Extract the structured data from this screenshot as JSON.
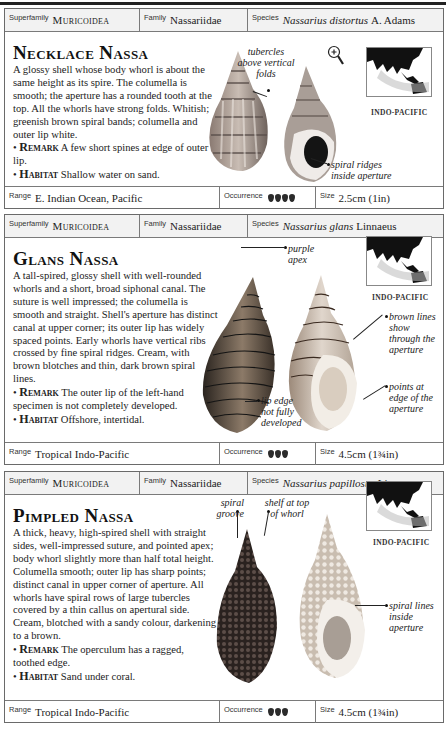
{
  "entries": [
    {
      "superfamily_label": "Superfamily",
      "superfamily": "Muricoidea",
      "family_label": "Family",
      "family": "Nassariidae",
      "species_label": "Species",
      "species_name": "Nassarius distortus",
      "species_author": "A. Adams",
      "title": "Necklace Nassa",
      "description": "A glossy shell whose body whorl is about the same height as its spire. The columella is smooth; the aperture has a rounded tooth at the top. All the whorls have strong folds. Whitish; greenish brown spiral bands; columella and outer lip white.",
      "remark_label": "Remark",
      "remark": "A few short spines at edge of outer lip.",
      "habitat_label": "Habitat",
      "habitat": "Shallow water on sand.",
      "annotations": [
        "tubercles above vertical folds",
        "spiral ridges inside aperture"
      ],
      "map_caption": "INDO-PACIFIC",
      "magnifier_icon": "magnifier-plus-icon",
      "range_label": "Range",
      "range": "E. Indian Ocean, Pacific",
      "occurrence_label": "Occurrence",
      "occurrence_count": 4,
      "size_label": "Size",
      "size": "2.5cm (1in)"
    },
    {
      "superfamily_label": "Superfamily",
      "superfamily": "Muricoidea",
      "family_label": "Family",
      "family": "Nassariidae",
      "species_label": "Species",
      "species_name": "Nassarius glans",
      "species_author": "Linnaeus",
      "title": "Glans Nassa",
      "description": "A tall-spired, glossy shell with well-rounded whorls and a short, broad siphonal canal. The suture is well impressed; the columella is smooth and straight. Shell's aperture has distinct canal at upper corner; its outer lip has widely spaced points. Early whorls have vertical ribs crossed by fine spiral ridges. Cream, with brown blotches and thin, dark brown spiral lines.",
      "remark_label": "Remark",
      "remark": "The outer lip of the left-hand specimen is not completely developed.",
      "habitat_label": "Habitat",
      "habitat": "Offshore, intertidal.",
      "annotations": [
        "purple apex",
        "brown lines show through the aperture",
        "lip edge not fully developed",
        "points at edge of the aperture"
      ],
      "map_caption": "INDO-PACIFIC",
      "range_label": "Range",
      "range": "Tropical Indo-Pacific",
      "occurrence_label": "Occurrence",
      "occurrence_count": 3,
      "size_label": "Size",
      "size": "4.5cm (1¾in)"
    },
    {
      "superfamily_label": "Superfamily",
      "superfamily": "Muricoidea",
      "family_label": "Family",
      "family": "Nassariidae",
      "species_label": "Species",
      "species_name": "Nassarius papillosus",
      "species_author": "Linnaeus",
      "title": "Pimpled Nassa",
      "description": "A thick, heavy, high-spired shell with straight sides, well-impressed suture, and pointed apex; body whorl slightly more than half total height. Columella smooth; outer lip has sharp points; distinct canal in upper corner of aperture. All whorls have spiral rows of large tubercles covered by a thin callus on apertural side. Cream, blotched with a sandy colour, darkening to a brown.",
      "remark_label": "Remark",
      "remark": "The operculum has a ragged, toothed edge.",
      "habitat_label": "Habitat",
      "habitat": "Sand under coral.",
      "annotations": [
        "spiral groove",
        "shelf at top of whorl",
        "spiral lines inside aperture"
      ],
      "map_caption": "INDO-PACIFIC",
      "range_label": "Range",
      "range": "Tropical Indo-Pacific",
      "occurrence_label": "Occurrence",
      "occurrence_count": 3,
      "size_label": "Size",
      "size": "4.5cm (1¾in)"
    }
  ]
}
